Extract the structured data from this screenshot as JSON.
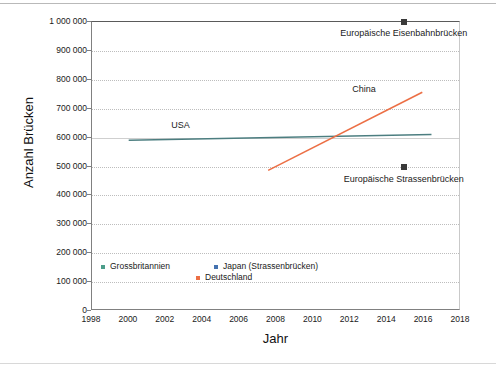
{
  "chart_data": {
    "type": "line",
    "title": "",
    "xlabel": "Jahr",
    "ylabel": "Anzahl Brücken",
    "xlim": [
      1998,
      2018
    ],
    "ylim": [
      0,
      1000000
    ],
    "grid": true,
    "legend_position": "inside-bottom-left",
    "xticks": [
      "1998",
      "2000",
      "2002",
      "2004",
      "2006",
      "2008",
      "2010",
      "2012",
      "2014",
      "2016",
      "2018"
    ],
    "xtick_values": [
      1998,
      2000,
      2002,
      2004,
      2006,
      2008,
      2010,
      2012,
      2014,
      2016,
      2018
    ],
    "yticks": [
      "0",
      "100 000",
      "200 000",
      "300 000",
      "400 000",
      "500 000",
      "600 000",
      "700 000",
      "800 000",
      "900 000",
      "1 000 000"
    ],
    "ytick_values": [
      0,
      100000,
      200000,
      300000,
      400000,
      500000,
      600000,
      700000,
      800000,
      900000,
      1000000
    ],
    "series": [
      {
        "name": "USA",
        "color": "#4c7e80",
        "style": "line",
        "x": [
          2000,
          2016.5
        ],
        "values": [
          588000,
          608000
        ]
      },
      {
        "name": "China",
        "color": "#ec6f45",
        "style": "line",
        "x": [
          2007.6,
          2016.0
        ],
        "values": [
          483000,
          755000
        ]
      },
      {
        "name": "Europäische Eisenbahnbrücken",
        "color": "#3a3a3a",
        "style": "marker",
        "x": [
          2014.9
        ],
        "values": [
          1000000
        ]
      },
      {
        "name": "Europäische Strassenbrücken",
        "color": "#3a3a3a",
        "style": "marker",
        "x": [
          2014.9
        ],
        "values": [
          500000
        ]
      }
    ],
    "annotations": [
      {
        "text": "USA",
        "x": 2002.3,
        "y": 640000
      },
      {
        "text": "China",
        "x": 2012.1,
        "y": 765000
      },
      {
        "text": "Europäische Eisenbahnbrücken",
        "x": 2014.9,
        "y": 960000
      },
      {
        "text": "Europäische Strassenbrücken",
        "x": 2014.9,
        "y": 455000
      }
    ],
    "legend": [
      {
        "label": "Grossbritannien",
        "color": "#4c9e8a"
      },
      {
        "label": "Japan (Strassenbrücken)",
        "color": "#4472b0"
      },
      {
        "label": "Deutschland",
        "color": "#ec6f45"
      }
    ]
  }
}
